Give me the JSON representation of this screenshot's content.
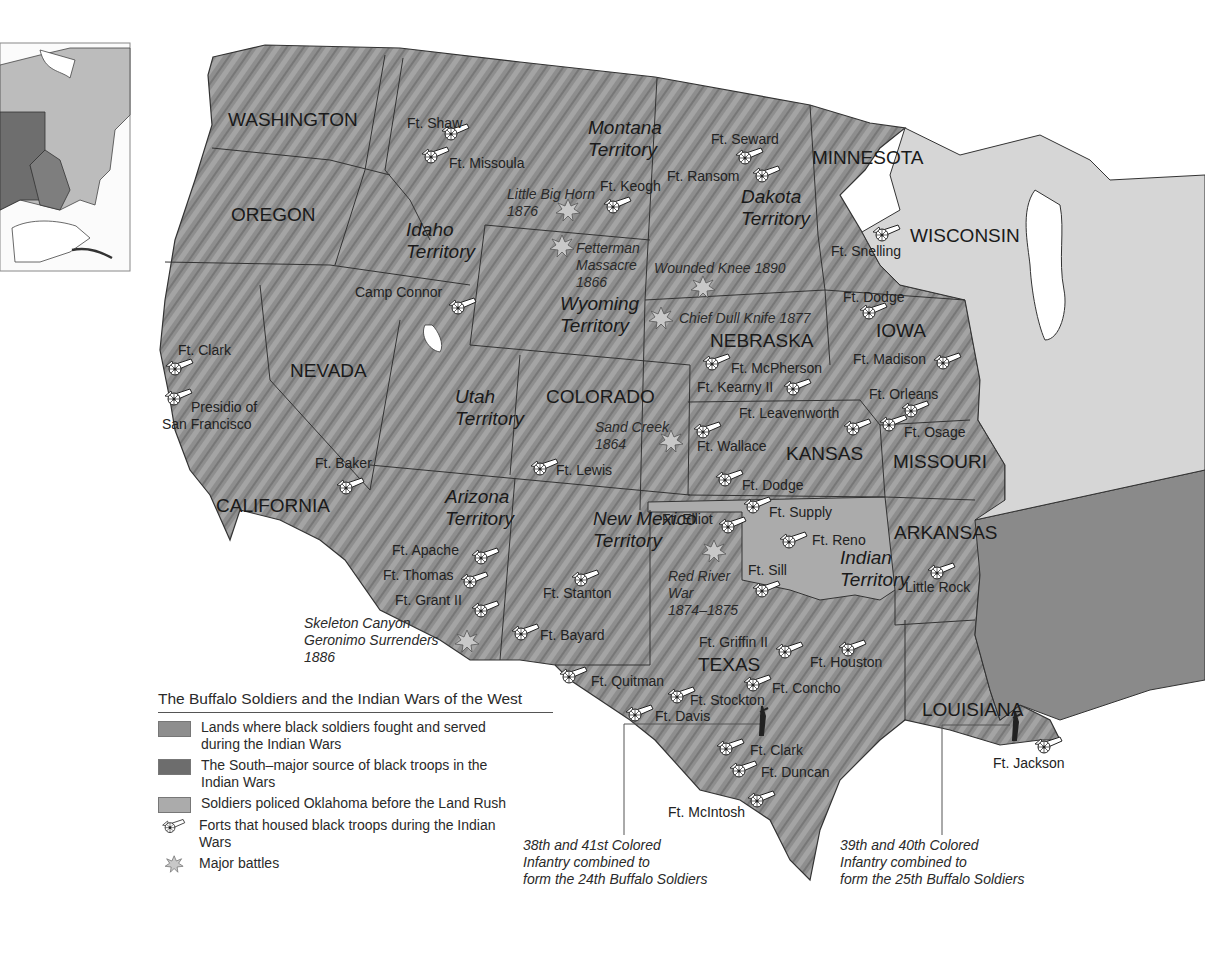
{
  "title": "The Buffalo Soldiers and the Indian Wars of the West",
  "colors": {
    "served_lands": "#8e8e8e",
    "south": "#6d6d6d",
    "oklahoma": "#ababab",
    "other_states": "#d6d6d6",
    "water": "#ffffff",
    "border": "#333333"
  },
  "legend": {
    "items": [
      {
        "type": "swatch",
        "color": "#8e8e8e",
        "label": "Lands where black soldiers fought and served during the Indian Wars"
      },
      {
        "type": "swatch",
        "color": "#6d6d6d",
        "label": "The South–major source of black troops in the Indian Wars"
      },
      {
        "type": "swatch",
        "color": "#ababab",
        "label": "Soldiers policed Oklahoma before the Land Rush"
      },
      {
        "type": "fort-icon",
        "label": "Forts that housed black troops during the Indian Wars"
      },
      {
        "type": "battle-icon",
        "label": "Major battles"
      }
    ]
  },
  "states": [
    {
      "name": "WASHINGTON",
      "x": 228,
      "y": 126
    },
    {
      "name": "OREGON",
      "x": 231,
      "y": 221
    },
    {
      "name": "NEVADA",
      "x": 290,
      "y": 377
    },
    {
      "name": "CALIFORNIA",
      "x": 216,
      "y": 512
    },
    {
      "name": "COLORADO",
      "x": 546,
      "y": 403
    },
    {
      "name": "NEBRASKA",
      "x": 710,
      "y": 347
    },
    {
      "name": "KANSAS",
      "x": 786,
      "y": 460
    },
    {
      "name": "MINNESOTA",
      "x": 812,
      "y": 164
    },
    {
      "name": "WISCONSIN",
      "x": 910,
      "y": 242
    },
    {
      "name": "IOWA",
      "x": 876,
      "y": 337
    },
    {
      "name": "MISSOURI",
      "x": 893,
      "y": 468
    },
    {
      "name": "ARKANSAS",
      "x": 894,
      "y": 539
    },
    {
      "name": "TEXAS",
      "x": 698,
      "y": 671
    },
    {
      "name": "LOUISIANA",
      "x": 922,
      "y": 716
    }
  ],
  "territories": [
    {
      "name": [
        "Montana",
        "Territory"
      ],
      "x": 588,
      "y": 134
    },
    {
      "name": [
        "Dakota",
        "Territory"
      ],
      "x": 741,
      "y": 203
    },
    {
      "name": [
        "Idaho",
        "Territory"
      ],
      "x": 406,
      "y": 236
    },
    {
      "name": [
        "Wyoming",
        "Territory"
      ],
      "x": 560,
      "y": 310
    },
    {
      "name": [
        "Utah",
        "Territory"
      ],
      "x": 455,
      "y": 403
    },
    {
      "name": [
        "Arizona",
        "Territory"
      ],
      "x": 445,
      "y": 503
    },
    {
      "name": [
        "New Mexico",
        "Territory"
      ],
      "x": 593,
      "y": 525
    },
    {
      "name": [
        "Indian",
        "Territory"
      ],
      "x": 840,
      "y": 564
    }
  ],
  "forts": [
    {
      "name": "Ft. Shaw",
      "x": 454,
      "y": 132,
      "lx": 407,
      "ly": 128
    },
    {
      "name": "Ft. Missoula",
      "x": 434,
      "y": 155,
      "lx": 449,
      "ly": 168
    },
    {
      "name": "Ft. Keogh",
      "x": 616,
      "y": 205,
      "lx": 600,
      "ly": 191
    },
    {
      "name": "Ft. Seward",
      "x": 748,
      "y": 156,
      "lx": 711,
      "ly": 144
    },
    {
      "name": "Ft. Ransom",
      "x": 765,
      "y": 174,
      "lx": 667,
      "ly": 181
    },
    {
      "name": "Ft. Snelling",
      "x": 885,
      "y": 233,
      "lx": 831,
      "ly": 256
    },
    {
      "name": "Camp Connor",
      "x": 461,
      "y": 306,
      "lx": 355,
      "ly": 297
    },
    {
      "name": "Ft. Dodge",
      "x": 872,
      "y": 311,
      "lx": 843,
      "ly": 302
    },
    {
      "name": "Ft. Madison",
      "x": 946,
      "y": 361,
      "lx": 853,
      "ly": 364
    },
    {
      "name": "Ft. Clark",
      "x": 178,
      "y": 367,
      "lx": 178,
      "ly": 355
    },
    {
      "name": "Ft. McPherson",
      "x": 715,
      "y": 362,
      "lx": 731,
      "ly": 373
    },
    {
      "name": "Ft. Kearny II",
      "x": 796,
      "y": 387,
      "lx": 697,
      "ly": 392
    },
    {
      "name": "Ft. Orleans",
      "x": 914,
      "y": 409,
      "lx": 869,
      "ly": 399
    },
    {
      "name": "Ft. Leavenworth",
      "x": 856,
      "y": 427,
      "lx": 739,
      "ly": 418
    },
    {
      "name": "Ft. Osage",
      "x": 892,
      "y": 423,
      "lx": 904,
      "ly": 437
    },
    {
      "name": "Ft. Wallace",
      "x": 706,
      "y": 430,
      "lx": 697,
      "ly": 451
    },
    {
      "name": "Presidio of San Francisco",
      "x": 177,
      "y": 397,
      "lx": 191,
      "ly": 412
    },
    {
      "name": "Ft. Lewis",
      "x": 543,
      "y": 467,
      "lx": 556,
      "ly": 475
    },
    {
      "name": "Ft. Baker",
      "x": 349,
      "y": 486,
      "lx": 315,
      "ly": 468
    },
    {
      "name": "Ft. Dodge",
      "x": 728,
      "y": 478,
      "lx": 742,
      "ly": 490
    },
    {
      "name": "Ft. Supply",
      "x": 756,
      "y": 505,
      "lx": 769,
      "ly": 517
    },
    {
      "name": "Ft. Elliot",
      "x": 731,
      "y": 525,
      "lx": 662,
      "ly": 524
    },
    {
      "name": "Ft. Reno",
      "x": 792,
      "y": 540,
      "lx": 812,
      "ly": 545
    },
    {
      "name": "Ft. Apache",
      "x": 484,
      "y": 556,
      "lx": 392,
      "ly": 555
    },
    {
      "name": "Ft. Thomas",
      "x": 473,
      "y": 580,
      "lx": 383,
      "ly": 580
    },
    {
      "name": "Ft. Sill",
      "x": 765,
      "y": 589,
      "lx": 748,
      "ly": 575
    },
    {
      "name": "Ft. Stanton",
      "x": 584,
      "y": 578,
      "lx": 543,
      "ly": 598
    },
    {
      "name": "Little Rock",
      "x": 940,
      "y": 571,
      "lx": 905,
      "ly": 592
    },
    {
      "name": "Ft. Grant II",
      "x": 484,
      "y": 609,
      "lx": 395,
      "ly": 605
    },
    {
      "name": "Ft. Bayard",
      "x": 524,
      "y": 632,
      "lx": 540,
      "ly": 640
    },
    {
      "name": "Ft. Griffin II",
      "x": 788,
      "y": 650,
      "lx": 699,
      "ly": 647
    },
    {
      "name": "Ft. Houston",
      "x": 851,
      "y": 648,
      "lx": 810,
      "ly": 667
    },
    {
      "name": "Ft. Quitman",
      "x": 572,
      "y": 675,
      "lx": 591,
      "ly": 686
    },
    {
      "name": "Ft. Concho",
      "x": 756,
      "y": 683,
      "lx": 772,
      "ly": 693
    },
    {
      "name": "Ft. Stockton",
      "x": 680,
      "y": 695,
      "lx": 690,
      "ly": 705
    },
    {
      "name": "Ft. Davis",
      "x": 638,
      "y": 713,
      "lx": 655,
      "ly": 721
    },
    {
      "name": "Ft. Clark",
      "x": 729,
      "y": 747,
      "lx": 750,
      "ly": 755
    },
    {
      "name": "Ft. Duncan",
      "x": 742,
      "y": 769,
      "lx": 761,
      "ly": 777
    },
    {
      "name": "Ft. McIntosh",
      "x": 760,
      "y": 799,
      "lx": 668,
      "ly": 817
    },
    {
      "name": "Ft. Jackson",
      "x": 1047,
      "y": 745,
      "lx": 993,
      "ly": 768
    }
  ],
  "battles": [
    {
      "name": [
        "Little Big Horn",
        "1876"
      ],
      "x": 568,
      "y": 210,
      "lx": 507,
      "ly": 199
    },
    {
      "name": [
        "Fetterman",
        "Massacre",
        "1866"
      ],
      "x": 562,
      "y": 246,
      "lx": 576,
      "ly": 253
    },
    {
      "name": [
        "Wounded Knee 1890"
      ],
      "x": 703,
      "y": 287,
      "lx": 654,
      "ly": 273
    },
    {
      "name": [
        "Chief Dull Knife 1877"
      ],
      "x": 661,
      "y": 318,
      "lx": 679,
      "ly": 323
    },
    {
      "name": [
        "Sand Creek",
        "1864"
      ],
      "x": 671,
      "y": 441,
      "lx": 595,
      "ly": 432
    },
    {
      "name": [
        "Red River",
        "War",
        "1874–1875"
      ],
      "x": 714,
      "y": 551,
      "lx": 668,
      "ly": 581
    },
    {
      "name": [
        "Skeleton Canyon",
        "Geronimo Surrenders",
        "1886"
      ],
      "x": 467,
      "y": 641,
      "lx": 304,
      "ly": 628
    }
  ],
  "notes": [
    {
      "lines": [
        "38th and 41st Colored",
        "Infantry combined to",
        "form the 24th Buffalo Soldiers"
      ],
      "x": 523,
      "y": 850,
      "lead_x": 624,
      "lead_y1": 724,
      "lead_y2": 835,
      "lead_x2": 762
    },
    {
      "lines": [
        "39th and 40th Colored",
        "Infantry combined to",
        "form the 25th Buffalo Soldiers"
      ],
      "x": 840,
      "y": 850,
      "lead_x": 942,
      "lead_y1": 725,
      "lead_y2": 835,
      "lead_x2": 1010
    }
  ]
}
